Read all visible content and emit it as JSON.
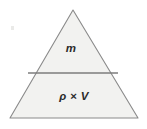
{
  "diagram": {
    "type": "formula-triangle",
    "background_color": "#ffffff",
    "fill_color": "#f2f2f0",
    "stroke_color": "#8a8a8a",
    "divider_color": "#7c7c7c",
    "text_color": "#2b2b2b",
    "geometry": {
      "apex": [
        73,
        10
      ],
      "base_left": [
        10,
        118
      ],
      "base_right": [
        138,
        118
      ],
      "divider_left": [
        28,
        73
      ],
      "divider_right": [
        118,
        73
      ],
      "stroke_width": 1
    },
    "sections": [
      {
        "id": "upper",
        "name": "mass",
        "label": "m",
        "center": [
          71,
          49
        ]
      },
      {
        "id": "lower",
        "name": "density-times-volume",
        "label": "ρ × V",
        "center": [
          74,
          97
        ]
      }
    ]
  }
}
